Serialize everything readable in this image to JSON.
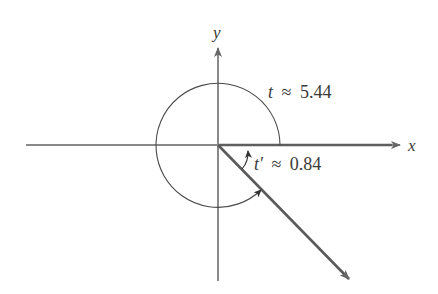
{
  "figure": {
    "type": "angle-diagram",
    "axes": {
      "x_label": "x",
      "y_label": "y"
    },
    "angles": {
      "t": {
        "symbol": "t",
        "approx": "≈",
        "value": "5.44",
        "text": "t ≈ 5.44"
      },
      "t_prime": {
        "symbol": "t′",
        "approx": "≈",
        "value": "0.84",
        "text": "t′ ≈ 0.84"
      }
    },
    "colors": {
      "axis": "#7a7a7a",
      "ray": "#5a5a5a",
      "arc": "#4a4a4a",
      "text": "#3a3a3a",
      "background": "#ffffff"
    }
  }
}
